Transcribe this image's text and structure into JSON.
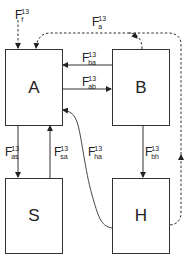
{
  "diagram": {
    "compartments": [
      {
        "id": "A",
        "label": "A"
      },
      {
        "id": "B",
        "label": "B"
      },
      {
        "id": "S",
        "label": "S"
      },
      {
        "id": "H",
        "label": "H"
      }
    ],
    "fluxes": {
      "f": {
        "symbol": "F",
        "sup": "13",
        "sub": "f",
        "from": "external",
        "to": "A",
        "style": "dashed"
      },
      "a": {
        "symbol": "F",
        "sup": "13",
        "sub": "a",
        "from": "B,H",
        "to": "A",
        "style": "dashed"
      },
      "ba": {
        "symbol": "F",
        "sup": "13",
        "sub": "ba",
        "from": "B",
        "to": "A",
        "style": "solid"
      },
      "ab": {
        "symbol": "F",
        "sup": "13",
        "sub": "ab",
        "from": "A",
        "to": "B",
        "style": "solid"
      },
      "as": {
        "symbol": "F",
        "sup": "13",
        "sub": "as",
        "from": "A",
        "to": "S",
        "style": "solid"
      },
      "sa": {
        "symbol": "F",
        "sup": "13",
        "sub": "sa",
        "from": "S",
        "to": "A",
        "style": "solid"
      },
      "ha": {
        "symbol": "F",
        "sup": "13",
        "sub": "ha",
        "from": "H",
        "to": "A",
        "style": "solid"
      },
      "bh": {
        "symbol": "F",
        "sup": "13",
        "sub": "bh",
        "from": "B",
        "to": "H",
        "style": "solid"
      }
    }
  }
}
